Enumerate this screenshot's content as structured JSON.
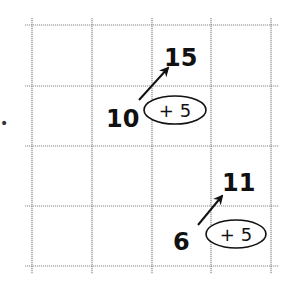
{
  "diagram": {
    "title": "",
    "grid": {
      "columns": 4,
      "rows": 4
    },
    "problems": [
      {
        "start": "10",
        "operation": "+ 5",
        "result": "15"
      },
      {
        "start": "6",
        "operation": "+ 5",
        "result": "11"
      }
    ],
    "edge_mark": "•",
    "colors": {
      "ink": "#111111",
      "grid": "#8a8a8a",
      "background": "#ffffff"
    }
  }
}
